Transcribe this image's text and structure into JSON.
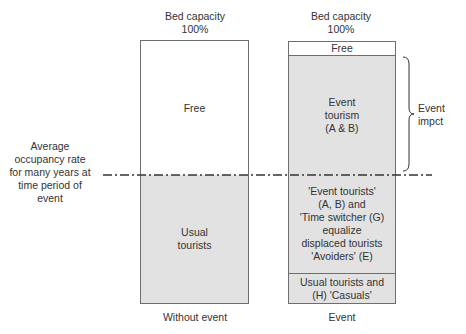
{
  "colors": {
    "shaded": "#e2e2e2",
    "border": "#6e6e6e",
    "text": "#333333",
    "background": "#ffffff"
  },
  "left_column": {
    "top_label": [
      "Bed capacity",
      "100%"
    ],
    "free_label": "Free",
    "usual_label": [
      "Usual",
      "tourists"
    ],
    "bottom_label": "Without event"
  },
  "right_column": {
    "top_label": [
      "Bed capacity",
      "100%"
    ],
    "free_label": "Free",
    "event_tourism_label": [
      "Event",
      "tourism",
      "(A & B)"
    ],
    "equalize_label": [
      "'Event tourists'",
      "(A, B) and",
      "'Time switcher (G)",
      "equalize",
      "displaced tourists",
      "'Avoiders' (E)"
    ],
    "usual_casuals_label": [
      "Usual tourists and",
      "(H) 'Casuals'"
    ],
    "bottom_label": "Event"
  },
  "average_line_label": [
    "Average",
    "occupancy rate",
    "for many years at",
    "time period of",
    "event"
  ],
  "brace_label": [
    "Event",
    "impct"
  ]
}
